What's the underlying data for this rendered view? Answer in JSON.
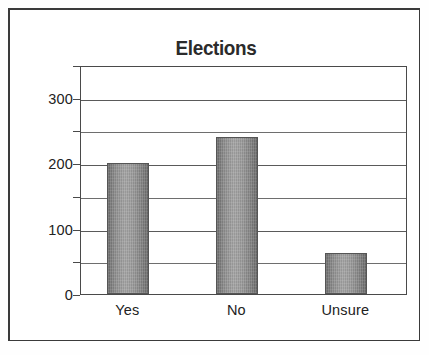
{
  "figure": {
    "title": "Elections",
    "background_color": "#ffffff",
    "frame_color": "#3a3a3a",
    "bar_fill_color": "#8d8d8d",
    "bar_border_color": "#555555",
    "gridline_color": "#6e6e6e",
    "axis_color": "#4a4a4a",
    "text_color": "#222222"
  },
  "chart_data": {
    "type": "bar",
    "title": "Elections",
    "xlabel": "",
    "ylabel": "",
    "categories": [
      "Yes",
      "No",
      "Unsure"
    ],
    "values": [
      200,
      240,
      62
    ],
    "series": [
      {
        "name": "Responses",
        "values": [
          200,
          240,
          62
        ]
      }
    ],
    "ylim": [
      0,
      350
    ],
    "ytick_labels": [
      "0",
      "100",
      "200",
      "300"
    ],
    "ytick_values": [
      0,
      100,
      200,
      300
    ],
    "gridline_values": [
      50,
      100,
      150,
      200,
      250,
      300,
      350
    ],
    "grid": true,
    "legend": false,
    "legend_position": "none"
  }
}
